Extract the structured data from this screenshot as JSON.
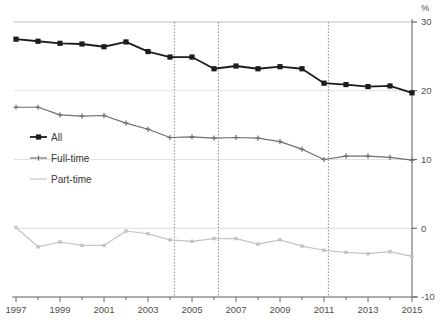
{
  "axis_unit_label": "%",
  "top_note": "",
  "chart_data": {
    "type": "line",
    "title": "",
    "subtitle": "",
    "xlabel": "",
    "ylabel": "%",
    "xlim": [
      1997,
      2015
    ],
    "ylim": [
      -10,
      30
    ],
    "ytick_labels": [
      "30",
      "20",
      "10",
      "0",
      "-10"
    ],
    "yticks": [
      30,
      20,
      10,
      0,
      -10
    ],
    "xtick_labels": [
      "1997",
      "1999",
      "2001",
      "2003",
      "2005",
      "2007",
      "2009",
      "2011",
      "2013",
      "2015"
    ],
    "xticks": [
      1997,
      1999,
      2001,
      2003,
      2005,
      2007,
      2009,
      2011,
      2013,
      2015
    ],
    "x": [
      1997,
      1998,
      1999,
      2000,
      2001,
      2002,
      2003,
      2004,
      2005,
      2006,
      2007,
      2008,
      2009,
      2010,
      2011,
      2012,
      2013,
      2014,
      2015
    ],
    "grid": "horizontal",
    "legend_position": "inside-left",
    "vertical_markers": [
      2004.2,
      2006.2,
      2011.2
    ],
    "series": [
      {
        "name": "All",
        "color": "#1c1c1c",
        "marker": "square",
        "values": [
          27.5,
          27.2,
          26.9,
          26.8,
          26.4,
          27.1,
          25.7,
          24.9,
          24.9,
          23.2,
          23.6,
          23.2,
          23.5,
          23.2,
          21.1,
          20.9,
          20.6,
          20.7,
          19.7
        ]
      },
      {
        "name": "Full-time",
        "color": "#6e6e6e",
        "marker": "cross",
        "values": [
          17.6,
          17.6,
          16.5,
          16.3,
          16.4,
          15.3,
          14.4,
          13.2,
          13.3,
          13.1,
          13.2,
          13.1,
          12.6,
          11.5,
          10.0,
          10.5,
          10.5,
          10.3,
          9.9
        ]
      },
      {
        "name": "Part-time",
        "color": "#c3c3c3",
        "marker": "dot",
        "values": [
          0.1,
          -2.7,
          -2.0,
          -2.5,
          -2.5,
          -0.4,
          -0.8,
          -1.7,
          -1.9,
          -1.5,
          -1.5,
          -2.3,
          -1.7,
          -2.6,
          -3.2,
          -3.5,
          -3.7,
          -3.4,
          -4.1
        ]
      }
    ]
  },
  "legend": {
    "items": [
      {
        "label": "All"
      },
      {
        "label": "Full-time"
      },
      {
        "label": "Part-time"
      }
    ]
  }
}
